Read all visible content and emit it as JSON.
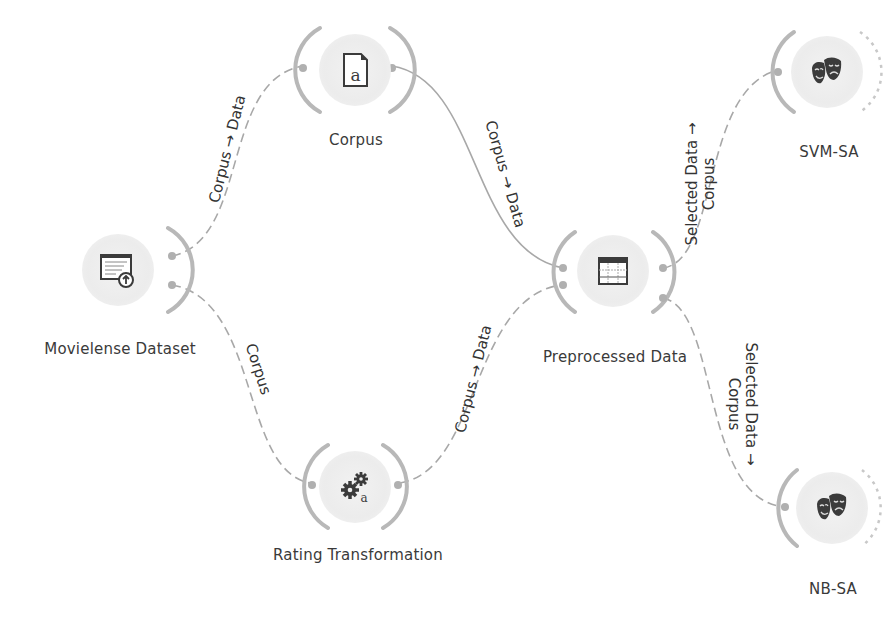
{
  "canvas": {
    "nodes": [
      {
        "id": "movielense",
        "label": "Movielense Dataset",
        "icon": "corpus-upload-icon"
      },
      {
        "id": "corpus",
        "label": "Corpus",
        "icon": "document-a-icon"
      },
      {
        "id": "rating",
        "label": "Rating Transformation",
        "icon": "gears-a-icon"
      },
      {
        "id": "preprocessed",
        "label": "Preprocessed Data",
        "icon": "data-table-icon"
      },
      {
        "id": "svm",
        "label": "SVM-SA",
        "icon": "theater-masks-icon"
      },
      {
        "id": "nb",
        "label": "NB-SA",
        "icon": "theater-masks-icon"
      }
    ],
    "links": [
      {
        "from": "movielense",
        "to": "corpus",
        "label": "Corpus → Data"
      },
      {
        "from": "movielense",
        "to": "rating",
        "label": "Corpus"
      },
      {
        "from": "corpus",
        "to": "preprocessed",
        "label": "Corpus → Data"
      },
      {
        "from": "rating",
        "to": "preprocessed",
        "label": "Corpus → Data"
      },
      {
        "from": "preprocessed",
        "to": "svm",
        "label_line1": "Selected Data →",
        "label_line2": "Corpus"
      },
      {
        "from": "preprocessed",
        "to": "nb",
        "label_line1": "Selected Data →",
        "label_line2": "Corpus"
      }
    ]
  },
  "colors": {
    "link": "#a8a8a8",
    "port": "#b5b5b5",
    "icon": "#3b3b3b",
    "halo": "#ececec",
    "text": "#3a3a3a"
  }
}
